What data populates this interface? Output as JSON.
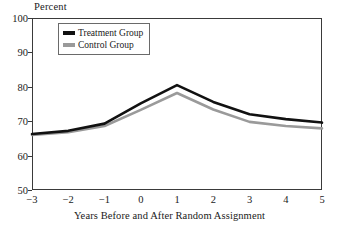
{
  "chart_data": {
    "type": "line",
    "title": "",
    "xlabel": "Years Before and After Random Assignment",
    "ylabel": "Percent",
    "x": [
      -3,
      -2,
      -1,
      0,
      1,
      2,
      3,
      4,
      5
    ],
    "xticklabels": [
      "−3",
      "−2",
      "−1",
      "0",
      "1",
      "2",
      "3",
      "4",
      "5"
    ],
    "yticklabels": [
      "50",
      "60",
      "70",
      "80",
      "90",
      "100"
    ],
    "yticks": [
      50,
      60,
      70,
      80,
      90,
      100
    ],
    "xlim": [
      -3,
      5
    ],
    "ylim": [
      50,
      100
    ],
    "grid": false,
    "legend_position": "top-left",
    "series": [
      {
        "name": "Treatment Group",
        "color": "#111111",
        "values": [
          66.3,
          67.2,
          69.3,
          75.2,
          80.5,
          75.6,
          72.0,
          70.6,
          69.6
        ]
      },
      {
        "name": "Control Group",
        "color": "#9a9a9a",
        "values": [
          66.0,
          66.8,
          68.6,
          73.3,
          78.2,
          73.4,
          69.8,
          68.6,
          67.9
        ]
      }
    ]
  },
  "legend": {
    "items": [
      {
        "label": "Treatment Group"
      },
      {
        "label": "Control Group"
      }
    ]
  },
  "colors": {
    "treatment": "#111111",
    "control": "#9a9a9a",
    "axis": "#3a3a3a",
    "background": "#ffffff"
  }
}
